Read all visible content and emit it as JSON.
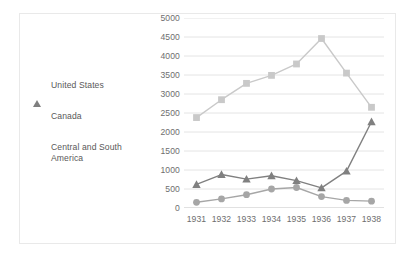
{
  "chart_data": {
    "type": "line",
    "title": "",
    "subtitle": "",
    "xlabel": "",
    "ylabel": "",
    "categories": [
      "1931",
      "1932",
      "1933",
      "1934",
      "1935",
      "1936",
      "1937",
      "1938"
    ],
    "x": [
      1931,
      1932,
      1933,
      1934,
      1935,
      1936,
      1937,
      1938
    ],
    "ylim": [
      0,
      5000
    ],
    "yticks": [
      0,
      500,
      1000,
      1500,
      2000,
      2500,
      3000,
      3500,
      4000,
      4500,
      5000
    ],
    "ytick_labels": [
      "0",
      "500",
      "1000",
      "1500",
      "2000",
      "2500",
      "3000",
      "3500",
      "4000",
      "4500",
      "5000"
    ],
    "grid": "horizontal",
    "legend_position": "left-outside",
    "series": [
      {
        "name": "United States",
        "marker": "triangle",
        "color": "#808080",
        "values": [
          620,
          880,
          760,
          850,
          720,
          530,
          970,
          2270
        ]
      },
      {
        "name": "Canada",
        "marker": "circle",
        "color": "#a6a6a6",
        "values": [
          150,
          240,
          350,
          500,
          540,
          300,
          200,
          180
        ]
      },
      {
        "name": "Central and South America",
        "marker": "square",
        "color": "#c9c9c9",
        "values": [
          2380,
          2850,
          3280,
          3490,
          3790,
          4460,
          3550,
          2650
        ]
      }
    ]
  },
  "legend": {
    "items": [
      {
        "label": "United States",
        "marker": "triangle-marker",
        "color": "#808080"
      },
      {
        "label": "Canada",
        "marker": "circle-marker",
        "color": "#a6a6a6"
      },
      {
        "label": "Central and South\nAmerica",
        "marker": "square-marker",
        "color": "#c9c9c9"
      }
    ]
  },
  "colors": {
    "united_states": "#808080",
    "canada": "#a6a6a6",
    "central_and_south_america": "#c9c9c9",
    "gridline": "#e4e4e4",
    "axis": "#d0d0d0",
    "text": "#6e6e6e",
    "border": "#e9e9e9",
    "background": "#ffffff"
  }
}
